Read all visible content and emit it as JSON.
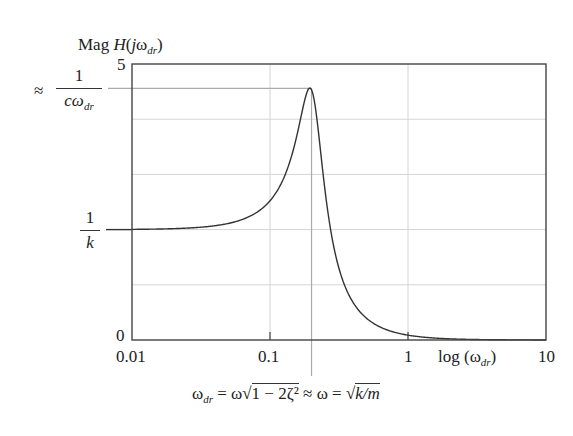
{
  "chart_data": {
    "type": "line",
    "title": "",
    "ylabel": "Mag H(jω_dr)",
    "xlabel": "log (ω_dr)",
    "xscale": "log",
    "xlim": [
      0.01,
      10
    ],
    "ylim": [
      0,
      5
    ],
    "grid": true,
    "x_ticks": [
      "0.01",
      "0.1",
      "1",
      "10"
    ],
    "y_ticks": [
      "0",
      "5"
    ],
    "y_annotations": [
      {
        "label": "≈ 1/(cω_dr)",
        "value": 4.56
      },
      {
        "label": "1/k",
        "value": 2
      }
    ],
    "x_annotations": [
      {
        "label": "ω_dr = ω√(1 − 2ζ²) ≈ ω = √(k/m)",
        "value": 0.2
      }
    ],
    "series": [
      {
        "name": "Magnitude",
        "x": [
          0.01,
          0.02,
          0.03,
          0.05,
          0.07,
          0.1,
          0.13,
          0.15,
          0.17,
          0.19,
          0.2,
          0.21,
          0.23,
          0.25,
          0.3,
          0.35,
          0.4,
          0.5,
          0.7,
          1,
          2,
          5,
          10
        ],
        "values": [
          2.0,
          2.02,
          2.04,
          2.13,
          2.26,
          2.55,
          3.0,
          3.45,
          4.0,
          4.5,
          4.56,
          4.5,
          3.9,
          3.1,
          1.8,
          1.15,
          0.8,
          0.46,
          0.22,
          0.1,
          0.025,
          0.004,
          0.001
        ]
      }
    ]
  },
  "labels": {
    "y_title_main": "Mag ",
    "y_title_H": "H",
    "y_title_open": "(",
    "y_title_j": "j",
    "y_title_omega": "ω",
    "y_title_sub": "dr",
    "y_title_close": ")",
    "y_tick_top": "5",
    "y_tick_bottom": "0",
    "peak_approx": "≈",
    "peak_num": "1",
    "peak_den_c": "cω",
    "peak_den_sub": "dr",
    "static_num": "1",
    "static_den": "k",
    "x_tick_0": "0.01",
    "x_tick_1": "0.1",
    "x_tick_2": "1",
    "x_tick_3": "10",
    "x_title_log": "log (ω",
    "x_title_sub": "dr",
    "x_title_close": ")",
    "formula_omega": "ω",
    "formula_sub": "dr",
    "formula_eq1": " = ω",
    "formula_root": "√",
    "formula_radicand": "1 − 2ζ²",
    "formula_approx": " ≈ ω = ",
    "formula_root2": "√",
    "formula_radicand2": "k/m"
  },
  "colors": {
    "curve": "#333333",
    "frame": "#444444",
    "grid": "#d4d4d4",
    "marker_line": "#aaaaaa"
  }
}
